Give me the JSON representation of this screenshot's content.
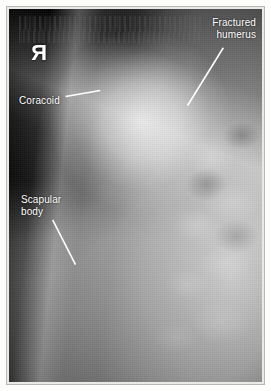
{
  "figure": {
    "kind": "radiograph",
    "modality": "x-ray",
    "view": "scapula / shoulder oblique",
    "background_color": "#ffffff",
    "frame_color": "#b9b9b4",
    "film_color": "#0a0a0a",
    "annotation_color": "#ffffff"
  },
  "side_marker": {
    "name": "right-side-marker",
    "text": "R",
    "mirrored": true,
    "note": "lead R marker appears reversed on film"
  },
  "annotations": [
    {
      "id": "fractured-humerus",
      "text": "Fractured\nhumerus",
      "line1": "Fractured",
      "line2": "humerus",
      "label_x": 205,
      "label_y": 14,
      "leader": {
        "x1": 222,
        "y1": 45,
        "x2": 186,
        "y2": 103
      }
    },
    {
      "id": "coracoid",
      "text": "Coracoid",
      "line1": "Coracoid",
      "line2": "",
      "label_x": 16,
      "label_y": 92,
      "leader": {
        "x1": 63,
        "y1": 94,
        "x2": 98,
        "y2": 88
      }
    },
    {
      "id": "scapular-body",
      "text": "Scapular\nbody",
      "line1": "Scapular",
      "line2": "body",
      "label_x": 18,
      "label_y": 191,
      "leader": {
        "x1": 50,
        "y1": 218,
        "x2": 73,
        "y2": 263
      }
    }
  ],
  "film_text": {
    "top_strip": "",
    "legible": false,
    "note": "faint illegible exposure annotation across top of film"
  }
}
